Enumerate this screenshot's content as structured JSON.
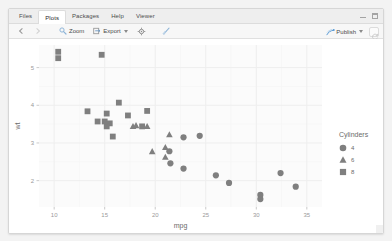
{
  "window": {
    "minimize_label": "minimize",
    "maximize_label": "maximize"
  },
  "tabs": [
    {
      "label": "Files",
      "active": false
    },
    {
      "label": "Plots",
      "active": true
    },
    {
      "label": "Packages",
      "active": false
    },
    {
      "label": "Help",
      "active": false
    },
    {
      "label": "Viewer",
      "active": false
    }
  ],
  "toolbar": {
    "back_label": "",
    "zoom_label": "Zoom",
    "export_label": "Export",
    "gear_label": "",
    "brush_label": "",
    "publish_label": "Publish",
    "refresh_label": ""
  },
  "colors": {
    "marker": "#7f7f7f",
    "panel": "#fbfbfb",
    "grid_major": "#eeeeee",
    "grid_minor": "#f6f6f6",
    "axis_text": "#9a9a9a",
    "axis_title": "#6a6a6a",
    "legend_text": "#6a6a6a",
    "tab_bar": "#eeeeee"
  },
  "chart_data": {
    "type": "scatter",
    "title": "",
    "xlabel": "mpg",
    "ylabel": "wt",
    "xlim": [
      8.5,
      36.5
    ],
    "ylim": [
      1.3,
      5.6
    ],
    "xticks": [
      10,
      15,
      20,
      25,
      30,
      35
    ],
    "yticks": [
      2,
      3,
      4,
      5
    ],
    "grid": true,
    "legend": {
      "title": "Cylinders",
      "position": "right",
      "entries": [
        {
          "label": "4",
          "shape": "circle"
        },
        {
          "label": "6",
          "shape": "triangle"
        },
        {
          "label": "8",
          "shape": "square"
        }
      ]
    },
    "series": [
      {
        "name": "4",
        "shape": "circle",
        "points": [
          {
            "x": 22.8,
            "y": 2.32
          },
          {
            "x": 24.4,
            "y": 3.19
          },
          {
            "x": 22.8,
            "y": 3.15
          },
          {
            "x": 32.4,
            "y": 2.2
          },
          {
            "x": 30.4,
            "y": 1.62
          },
          {
            "x": 33.9,
            "y": 1.84
          },
          {
            "x": 21.5,
            "y": 2.46
          },
          {
            "x": 27.3,
            "y": 1.94
          },
          {
            "x": 26.0,
            "y": 2.14
          },
          {
            "x": 30.4,
            "y": 1.51
          },
          {
            "x": 21.4,
            "y": 2.78
          }
        ]
      },
      {
        "name": "6",
        "shape": "triangle",
        "points": [
          {
            "x": 21.0,
            "y": 2.62
          },
          {
            "x": 21.0,
            "y": 2.88
          },
          {
            "x": 21.4,
            "y": 3.22
          },
          {
            "x": 18.1,
            "y": 3.46
          },
          {
            "x": 19.2,
            "y": 3.44
          },
          {
            "x": 17.8,
            "y": 3.44
          },
          {
            "x": 19.7,
            "y": 2.77
          }
        ]
      },
      {
        "name": "8",
        "shape": "square",
        "points": [
          {
            "x": 18.7,
            "y": 3.44
          },
          {
            "x": 14.3,
            "y": 3.57
          },
          {
            "x": 16.4,
            "y": 4.07
          },
          {
            "x": 17.3,
            "y": 3.73
          },
          {
            "x": 15.2,
            "y": 3.78
          },
          {
            "x": 10.4,
            "y": 5.25
          },
          {
            "x": 10.4,
            "y": 5.42
          },
          {
            "x": 14.7,
            "y": 5.34
          },
          {
            "x": 15.5,
            "y": 3.52
          },
          {
            "x": 15.2,
            "y": 3.44
          },
          {
            "x": 13.3,
            "y": 3.84
          },
          {
            "x": 19.2,
            "y": 3.85
          },
          {
            "x": 15.8,
            "y": 3.17
          },
          {
            "x": 15.0,
            "y": 3.57
          }
        ]
      }
    ]
  }
}
